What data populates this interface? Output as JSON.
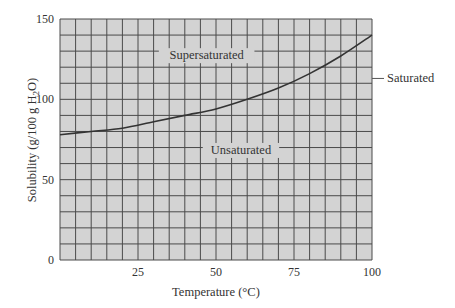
{
  "chart_data": {
    "type": "line",
    "title": "",
    "xlabel": "Temperature (°C)",
    "ylabel": "Solubility (g/100 g H2O)",
    "ylabel_parts": {
      "pre": "Solubility (g/100 g H",
      "sub": "2",
      "post": "O)"
    },
    "xlim": [
      0,
      100
    ],
    "ylim": [
      0,
      150
    ],
    "x_ticks": [
      25,
      50,
      75,
      100
    ],
    "y_ticks": [
      0,
      50,
      100,
      150
    ],
    "grid": {
      "on": true,
      "x_step": 5,
      "y_step": 10
    },
    "series": [
      {
        "name": "Saturated",
        "x": [
          0,
          10,
          20,
          30,
          40,
          50,
          60,
          70,
          80,
          90,
          100
        ],
        "values": [
          78,
          80,
          82,
          86,
          90,
          94,
          100,
          107,
          116,
          127,
          140
        ]
      }
    ],
    "annotations": [
      {
        "text": "Supersaturated",
        "x": 47,
        "y": 125
      },
      {
        "text": "Unsaturated",
        "x": 58,
        "y": 66
      },
      {
        "text": "Saturated",
        "x": 105,
        "y": 113,
        "leader_line": true
      }
    ]
  },
  "colors": {
    "plot_fill": "#d3d3d3",
    "grid_line": "#4a4a4a",
    "curve": "#333333",
    "label_bg": "#d3d3d3"
  }
}
